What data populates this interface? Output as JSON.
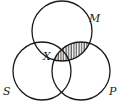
{
  "diagram": {
    "type": "venn",
    "circles": [
      {
        "id": "M",
        "label": "M",
        "cx": 62,
        "cy": 31,
        "r": 30
      },
      {
        "id": "S",
        "label": "S",
        "cx": 42,
        "cy": 71,
        "r": 29
      },
      {
        "id": "P",
        "label": "P",
        "cx": 81,
        "cy": 71,
        "r": 29
      }
    ],
    "labels": {
      "M": "M",
      "S": "S",
      "P": "P",
      "X": "X"
    },
    "shaded_region": "M ∩ P",
    "marked_region": "S ∩ M (outside P)",
    "colors": {
      "stroke": "#1a1a1a",
      "background": "#ffffff",
      "hatch": "#1a1a1a"
    }
  }
}
